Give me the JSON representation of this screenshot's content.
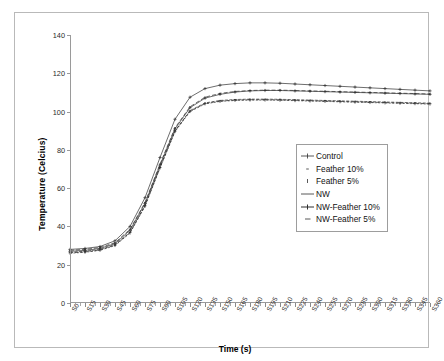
{
  "chart_data": {
    "type": "line",
    "title": "",
    "xlabel": "Time (s)",
    "ylabel": "Temperature (Celcius)",
    "ylim": [
      0,
      140
    ],
    "ytick_values": [
      0,
      20,
      40,
      60,
      80,
      100,
      120,
      140
    ],
    "ytick_step": 20,
    "grid": false,
    "legend_position": "center-right",
    "x_minor_tick_interval": 5,
    "x_major_tick_interval": 15,
    "categories": [
      "S0",
      "S15",
      "S30",
      "S45",
      "S60",
      "S75",
      "S90",
      "S105",
      "S120",
      "S135",
      "S150",
      "S165",
      "S180",
      "S195",
      "S210",
      "S225",
      "S240",
      "S255",
      "S270",
      "S285",
      "S300",
      "S315",
      "S330",
      "S345",
      "S360"
    ],
    "series": [
      {
        "name": "Control",
        "marker": "plus",
        "values": [
          27.0,
          27.5,
          28.5,
          31.0,
          38.0,
          52.0,
          72.0,
          91.0,
          102.0,
          107.0,
          109.0,
          110.2,
          110.8,
          111.0,
          111.0,
          110.8,
          110.6,
          110.4,
          110.2,
          110.0,
          109.8,
          109.6,
          109.4,
          109.2,
          109.0
        ]
      },
      {
        "name": "Feather 10%",
        "marker": "dot",
        "values": [
          26.5,
          27.0,
          28.0,
          30.5,
          37.0,
          51.0,
          71.0,
          90.0,
          100.5,
          104.5,
          105.8,
          106.3,
          106.5,
          106.5,
          106.4,
          106.2,
          106.0,
          105.8,
          105.6,
          105.4,
          105.2,
          105.0,
          104.8,
          104.6,
          104.4
        ]
      },
      {
        "name": "Feather 5%",
        "marker": "tick",
        "values": [
          26.0,
          26.5,
          27.5,
          30.0,
          36.5,
          50.5,
          70.5,
          89.5,
          100.0,
          104.0,
          105.3,
          105.8,
          106.0,
          106.0,
          105.9,
          105.7,
          105.5,
          105.3,
          105.1,
          104.9,
          104.7,
          104.5,
          104.3,
          104.1,
          103.9
        ]
      },
      {
        "name": "NW",
        "marker": "line",
        "values": [
          27.5,
          28.0,
          29.0,
          31.5,
          38.5,
          52.5,
          72.5,
          91.5,
          102.5,
          107.5,
          109.5,
          110.5,
          111.0,
          111.2,
          111.2,
          111.0,
          110.8,
          110.6,
          110.4,
          110.2,
          110.0,
          109.8,
          109.6,
          109.4,
          109.2
        ]
      },
      {
        "name": "NW-Feather 10%",
        "marker": "cross",
        "values": [
          28.0,
          28.5,
          29.5,
          32.5,
          40.0,
          55.0,
          76.0,
          96.0,
          107.5,
          112.0,
          113.8,
          114.6,
          115.0,
          115.0,
          114.8,
          114.4,
          114.0,
          113.6,
          113.2,
          112.8,
          112.4,
          112.0,
          111.6,
          111.2,
          110.8
        ]
      },
      {
        "name": "NW-Feather 5%",
        "marker": "dash",
        "values": [
          26.2,
          26.7,
          27.7,
          30.2,
          36.8,
          50.8,
          70.8,
          89.8,
          100.2,
          104.2,
          105.5,
          106.0,
          106.2,
          106.2,
          106.1,
          105.9,
          105.7,
          105.5,
          105.3,
          105.1,
          104.9,
          104.7,
          104.5,
          104.3,
          104.1
        ]
      }
    ]
  },
  "legend": {
    "entries": [
      {
        "label": "Control"
      },
      {
        "label": "Feather 10%"
      },
      {
        "label": "Feather 5%"
      },
      {
        "label": "NW"
      },
      {
        "label": "NW-Feather 10%"
      },
      {
        "label": "NW-Feather 5%"
      }
    ]
  },
  "colors": {
    "axis": "#9a9a9a",
    "frame": "#b9b9b9",
    "series": "#2e2e2e",
    "text": "#000000"
  }
}
